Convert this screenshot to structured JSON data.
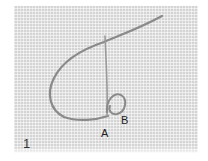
{
  "figure": {
    "step_number": "1",
    "point_labels": [
      "A",
      "B"
    ],
    "colors": {
      "fabric": "#d4d4d4",
      "thread": "#8a8a8a",
      "text": "#222222"
    }
  }
}
